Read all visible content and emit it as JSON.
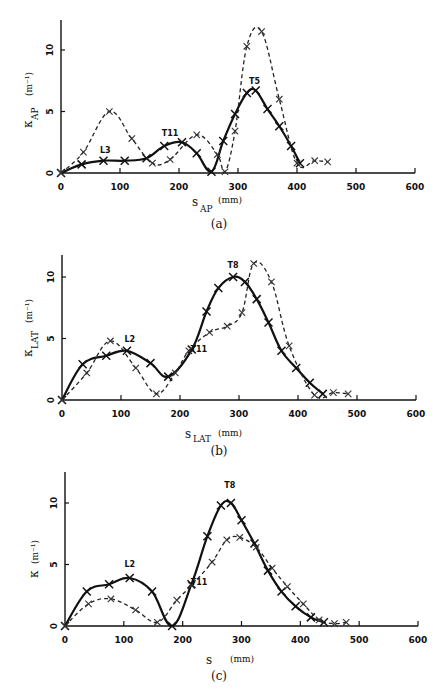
{
  "chart_data": [
    {
      "panel": "(a)",
      "type": "line",
      "xlabel": "s_AP (mm)",
      "ylabel": "κ_AP (m^-1)",
      "xlim": [
        0,
        600
      ],
      "ylim": [
        0,
        12.5
      ],
      "xticks": [
        0,
        100,
        200,
        300,
        400,
        500,
        600
      ],
      "yticks": [
        0,
        5,
        10
      ],
      "grid": false,
      "annotations": [
        {
          "text": "L3",
          "x": 75,
          "y": 1.6
        },
        {
          "text": "T11",
          "x": 185,
          "y": 3.0
        },
        {
          "text": "T5",
          "x": 328,
          "y": 7.2
        }
      ],
      "series": [
        {
          "name": "solid",
          "style": "solid",
          "x": [
            0,
            35,
            72,
            108,
            145,
            175,
            205,
            230,
            255,
            275,
            295,
            315,
            330,
            350,
            370,
            390,
            405
          ],
          "y": [
            0,
            0.7,
            1.0,
            1.0,
            1.2,
            2.2,
            2.5,
            1.6,
            0.1,
            2.6,
            4.8,
            6.5,
            6.7,
            5.2,
            3.8,
            2.2,
            0.8
          ]
        },
        {
          "name": "dashed",
          "style": "dashed",
          "x": [
            0,
            38,
            82,
            120,
            155,
            185,
            230,
            265,
            278,
            295,
            315,
            340,
            370,
            400,
            430,
            452
          ],
          "y": [
            0,
            1.7,
            5.0,
            2.8,
            0.8,
            1.1,
            3.1,
            1.5,
            0.1,
            3.4,
            10.3,
            11.5,
            6.0,
            0.8,
            1.0,
            0.9
          ]
        }
      ]
    },
    {
      "panel": "(b)",
      "type": "line",
      "xlabel": "s_LAT (mm)",
      "ylabel": "κ_LAT (m^-1)",
      "xlim": [
        0,
        600
      ],
      "ylim": [
        0,
        12
      ],
      "xticks": [
        0,
        100,
        200,
        300,
        400,
        500,
        600
      ],
      "yticks": [
        0,
        5,
        10
      ],
      "grid": false,
      "annotations": [
        {
          "text": "L2",
          "x": 115,
          "y": 4.7
        },
        {
          "text": "T11",
          "x": 232,
          "y": 3.9
        },
        {
          "text": "T8",
          "x": 290,
          "y": 10.7
        }
      ],
      "series": [
        {
          "name": "solid",
          "style": "solid",
          "x": [
            0,
            35,
            75,
            110,
            150,
            180,
            220,
            245,
            265,
            290,
            310,
            330,
            350,
            372,
            397,
            420,
            442
          ],
          "y": [
            0,
            2.9,
            3.6,
            4.0,
            3.0,
            1.9,
            4.1,
            7.2,
            9.1,
            10.0,
            9.6,
            8.2,
            6.3,
            4.0,
            2.6,
            1.4,
            0.5
          ]
        },
        {
          "name": "dashed",
          "style": "dashed",
          "x": [
            0,
            42,
            82,
            125,
            160,
            192,
            215,
            250,
            280,
            305,
            325,
            355,
            385,
            428,
            460,
            485
          ],
          "y": [
            0,
            2.2,
            4.8,
            2.6,
            0.5,
            2.2,
            4.0,
            5.5,
            6.0,
            7.1,
            11.1,
            9.6,
            4.4,
            0.4,
            0.6,
            0.5
          ]
        }
      ]
    },
    {
      "panel": "(c)",
      "type": "line",
      "xlabel": "s (mm)",
      "ylabel": "κ (m^-1)",
      "xlim": [
        0,
        600
      ],
      "ylim": [
        0,
        12.5
      ],
      "xticks": [
        0,
        100,
        200,
        300,
        400,
        500,
        600
      ],
      "yticks": [
        0,
        5,
        10
      ],
      "grid": false,
      "annotations": [
        {
          "text": "L2",
          "x": 110,
          "y": 4.8
        },
        {
          "text": "T11",
          "x": 228,
          "y": 3.3
        },
        {
          "text": "T8",
          "x": 280,
          "y": 11.2
        }
      ],
      "series": [
        {
          "name": "solid",
          "style": "solid",
          "x": [
            0,
            37,
            75,
            110,
            148,
            182,
            215,
            242,
            265,
            282,
            300,
            322,
            345,
            368,
            392,
            418,
            440
          ],
          "y": [
            0,
            2.8,
            3.4,
            3.9,
            2.8,
            0.0,
            3.4,
            7.3,
            9.8,
            10.0,
            8.6,
            6.7,
            4.5,
            2.8,
            1.6,
            0.7,
            0.3
          ]
        },
        {
          "name": "dashed",
          "style": "dashed",
          "x": [
            0,
            40,
            78,
            120,
            157,
            190,
            215,
            250,
            275,
            297,
            325,
            352,
            378,
            405,
            432,
            458,
            478
          ],
          "y": [
            0,
            1.8,
            2.2,
            1.3,
            0.3,
            2.1,
            3.3,
            5.2,
            7.0,
            7.2,
            6.4,
            4.7,
            3.2,
            1.8,
            0.5,
            0.2,
            0.3
          ]
        }
      ]
    }
  ],
  "panels": {
    "a": {
      "caption": "(a)",
      "ylabel_main": "κ",
      "ylabel_sub": "AP",
      "ylabel_unit": "(m⁻¹)",
      "xlabel_main": "s",
      "xlabel_sub": "AP",
      "xlabel_unit": "(mm)"
    },
    "b": {
      "caption": "(b)",
      "ylabel_main": "κ",
      "ylabel_sub": "LAT",
      "ylabel_unit": "(m⁻¹)",
      "xlabel_main": "s",
      "xlabel_sub": "LAT",
      "xlabel_unit": "(mm)"
    },
    "c": {
      "caption": "(c)",
      "ylabel_main": "κ",
      "ylabel_sub": "",
      "ylabel_unit": "(m⁻¹)",
      "xlabel_main": "s",
      "xlabel_sub": "",
      "xlabel_unit": "(mm)"
    }
  },
  "layout": [
    {
      "x0": 61,
      "x600": 415,
      "y0": 173,
      "y10": 50,
      "ytop": 20,
      "capY": 228,
      "xlabY": 205,
      "ylabX": 28,
      "ylabY": 100
    },
    {
      "x0": 62,
      "x600": 416,
      "y0": 400,
      "y10": 277,
      "ytop": 255,
      "capY": 455,
      "xlabY": 437,
      "ylabX": 28,
      "ylabY": 328
    },
    {
      "x0": 65,
      "x600": 418,
      "y0": 626,
      "y10": 503,
      "ytop": 472,
      "capY": 680,
      "xlabY": 663,
      "ylabX": 32,
      "ylabY": 560
    }
  ]
}
